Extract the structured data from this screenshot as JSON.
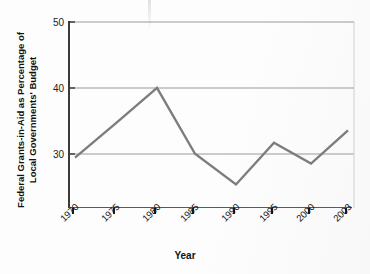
{
  "chart_data": {
    "type": "line",
    "title": "",
    "xlabel": "Year",
    "ylabel": "Federal Grants-in-Aid as Percentage of Local Governments' Budget",
    "categories": [
      "1970",
      "1975",
      "1980",
      "1985",
      "1990",
      "1995",
      "2000",
      "2003"
    ],
    "values": [
      29.2,
      34.5,
      39.9,
      29.8,
      25.1,
      31.5,
      28.3,
      33.4
    ],
    "series": [
      {
        "name": "Federal Grants-in-Aid",
        "values": [
          29.2,
          34.5,
          39.9,
          29.8,
          25.1,
          31.5,
          28.3,
          33.4
        ]
      }
    ],
    "ylim": [
      21.5,
      50
    ],
    "yticks": [
      30,
      40,
      50
    ],
    "ytick_labels": [
      "30",
      "40",
      "50"
    ],
    "grid": true,
    "grid_axis": "y",
    "legend": false,
    "line_color": "#7d7d7d",
    "grid_color": "#9a9a9a",
    "axis_color": "#3b3b3b",
    "text_color": "#111111"
  },
  "axis": {
    "y_ticks": [
      {
        "label": "50",
        "value": 50
      },
      {
        "label": "40",
        "value": 40
      },
      {
        "label": "30",
        "value": 30
      }
    ],
    "x_ticks": [
      {
        "label": "1970"
      },
      {
        "label": "1975"
      },
      {
        "label": "1980"
      },
      {
        "label": "1985"
      },
      {
        "label": "1990"
      },
      {
        "label": "1995"
      },
      {
        "label": "2000"
      },
      {
        "label": "2003"
      }
    ],
    "x_title": "Year",
    "y_title": "Federal Grants-in-Aid as Percentage of Local Governments' Budget"
  }
}
